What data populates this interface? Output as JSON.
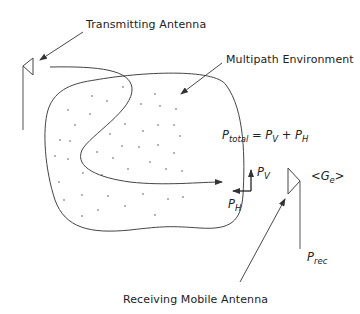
{
  "labels": {
    "transmitting_antenna": "Transmitting Antenna",
    "multipath_environment": "Multipath Environment",
    "receiving_mobile_antenna": "Receiving Mobile Antenna"
  },
  "equation": {
    "lhs_symbol": "P",
    "lhs_sub": "total",
    "equals": "=",
    "term1_symbol": "P",
    "term1_sub": "V",
    "plus": "+",
    "term2_symbol": "P",
    "term2_sub": "H"
  },
  "vectors": {
    "vertical_symbol": "P",
    "vertical_sub": "V",
    "horizontal_symbol": "P",
    "horizontal_sub": "H"
  },
  "gain": {
    "open": "<",
    "symbol": "G",
    "sub": "e",
    "close": ">"
  },
  "received_power": {
    "symbol": "P",
    "sub": "rec"
  },
  "colors": {
    "stroke": "#333333",
    "text": "#222222",
    "background": "#ffffff"
  }
}
